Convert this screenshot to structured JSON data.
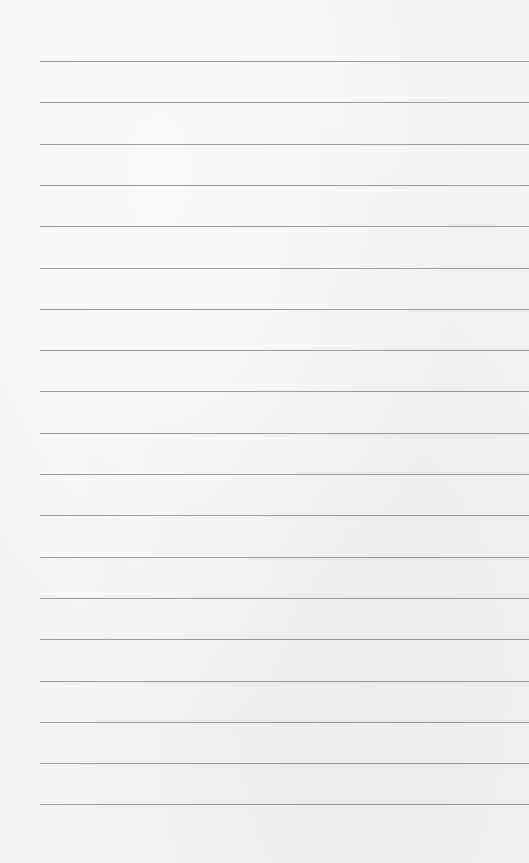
{
  "paper": {
    "type": "lined-paper",
    "background_color": "#f3f3f3",
    "line_color": "#9a9a9a",
    "line_count": 19,
    "line_left": 40,
    "first_line_y": 61,
    "line_spacing": 41.3
  }
}
